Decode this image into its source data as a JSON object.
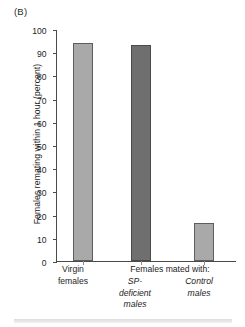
{
  "panel": {
    "label": "(B)"
  },
  "chart_data": {
    "type": "bar",
    "title": "",
    "xlabel": "",
    "ylabel": "Females remating within 1 hour (percent)",
    "ylim": [
      0,
      100
    ],
    "ytick_step": 10,
    "yticks": [
      100,
      90,
      80,
      70,
      60,
      50,
      40,
      30,
      20,
      10,
      0
    ],
    "grid": false,
    "legend": "none",
    "categories": [
      "Virgin females",
      "SP-deficient males",
      "Control males"
    ],
    "values": [
      94,
      93,
      16.4
    ],
    "group_header": "Females mated with:",
    "group_header_members": [
      "SP-deficient males",
      "Control males"
    ],
    "bars": [
      {
        "category": "Virgin females",
        "label_line1": "Virgin",
        "label_line2": "females",
        "label1_italic": false,
        "label2_italic": false,
        "value": 94,
        "color": "#a9a9a9",
        "edge_color": "#5d5d5d"
      },
      {
        "category": "SP-deficient males",
        "label_line1": "SP-",
        "label_line2": "deficient",
        "label_line3": "males",
        "label1_italic": true,
        "label2_italic": true,
        "value": 93,
        "color": "#6f6f6f",
        "edge_color": "#4a4a4a"
      },
      {
        "category": "Control males",
        "label_line1": "Control",
        "label_line2": "males",
        "label1_italic": true,
        "label2_italic": true,
        "value": 16.4,
        "color": "#a9a9a9",
        "edge_color": "#5d5d5d"
      }
    ]
  }
}
